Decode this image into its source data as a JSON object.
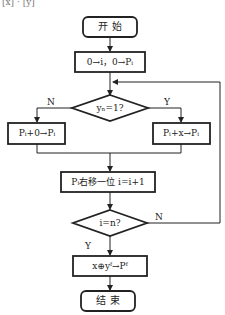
{
  "header_fragment": "[x] · [y]",
  "flowchart": {
    "start": "开  始",
    "init": "0→i，0→Pᵢ",
    "decision1": "yₙ=1?",
    "decision1_no": "N",
    "decision1_yes": "Y",
    "branch_no": "Pᵢ+0→Pᵢ",
    "branch_yes": "Pᵢ+x→Pᵢ",
    "shift": "Pᵢ右移一位 i=i+1",
    "decision2": "i=n?",
    "decision2_no": "N",
    "decision2_yes": "Y",
    "final_op": "x⊕yᶠ→Pᶠ",
    "end": "结  束"
  }
}
